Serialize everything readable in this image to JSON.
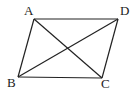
{
  "diagram": {
    "vertices": [
      {
        "name": "A",
        "x": 34,
        "y": 19,
        "label_x": 24,
        "label_y": 15
      },
      {
        "name": "D",
        "x": 118,
        "y": 19,
        "label_x": 120,
        "label_y": 15
      },
      {
        "name": "B",
        "x": 18,
        "y": 77,
        "label_x": 7,
        "label_y": 87
      },
      {
        "name": "C",
        "x": 102,
        "y": 78,
        "label_x": 101,
        "label_y": 88
      }
    ],
    "edges": [
      [
        "A",
        "D"
      ],
      [
        "D",
        "C"
      ],
      [
        "C",
        "B"
      ],
      [
        "B",
        "A"
      ]
    ],
    "diagonals": [
      [
        "A",
        "C"
      ],
      [
        "B",
        "D"
      ]
    ],
    "labels": {
      "a": "A",
      "b": "B",
      "c": "C",
      "d": "D"
    }
  }
}
